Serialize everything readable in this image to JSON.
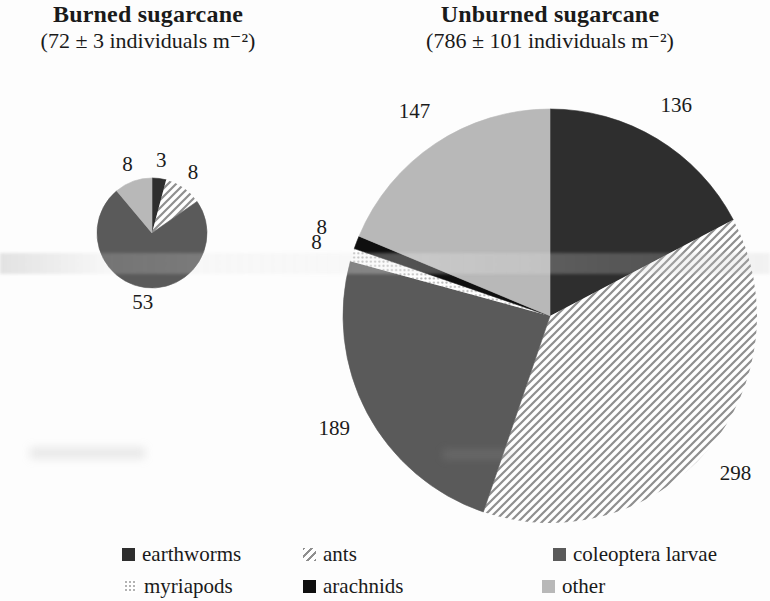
{
  "figure": {
    "kind": "two-pie-comparison, scanned book figure",
    "text_color": "#1a1a1a",
    "background": "#fdfdfd"
  },
  "legend": {
    "position": "bottom",
    "rows": 2,
    "items": [
      {
        "label": "earthworms",
        "fill": "#2e2e2e",
        "pattern": "solid"
      },
      {
        "label": "ants",
        "fill": "#ffffff",
        "pattern": "hatch",
        "hatch_color": "#8f8f8f"
      },
      {
        "label": "coleoptera larvae",
        "fill": "#5a5a5a",
        "pattern": "solid"
      },
      {
        "label": "myriapods",
        "fill": "#ffffff",
        "pattern": "dots",
        "dot_color": "#b3b3b3"
      },
      {
        "label": "arachnids",
        "fill": "#0f0f0f",
        "pattern": "solid"
      },
      {
        "label": "other",
        "fill": "#b8b8b8",
        "pattern": "solid"
      }
    ]
  },
  "chart_data": [
    {
      "type": "pie",
      "name": "burned-sugarcane",
      "title": "Burned sugarcane",
      "subtitle": "(72 ± 3 individuals m⁻²)",
      "total": 72,
      "total_sd": 3,
      "units": "individuals m⁻²",
      "categories": [
        "earthworms",
        "ants",
        "coleoptera larvae",
        "myriapods",
        "arachnids",
        "other"
      ],
      "values": [
        3,
        8,
        53,
        0,
        0,
        8
      ],
      "start_angle_deg": 0,
      "direction": "clockwise",
      "labels": "outside",
      "legend_shared": true
    },
    {
      "type": "pie",
      "name": "unburned-sugarcane",
      "title": "Unburned sugarcane",
      "subtitle": "(786 ± 101 individuals m⁻²)",
      "total": 786,
      "total_sd": 101,
      "units": "individuals m⁻²",
      "categories": [
        "earthworms",
        "ants",
        "coleoptera larvae",
        "myriapods",
        "arachnids",
        "other"
      ],
      "values": [
        136,
        298,
        189,
        8,
        8,
        147
      ],
      "start_angle_deg": 0,
      "direction": "clockwise",
      "labels": "outside",
      "legend_shared": true
    }
  ]
}
